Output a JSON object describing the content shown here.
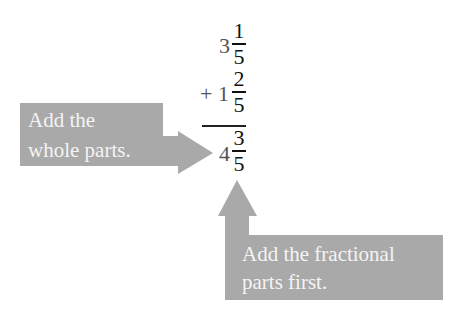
{
  "problem": {
    "addend1": {
      "whole": "3",
      "numerator": "1",
      "denominator": "5"
    },
    "addend2": {
      "sign": "+",
      "whole": "1",
      "numerator": "2",
      "denominator": "5"
    },
    "result": {
      "whole": "4",
      "numerator": "3",
      "denominator": "5"
    }
  },
  "callouts": {
    "whole": {
      "line1": "Add the",
      "line2": "whole parts."
    },
    "fraction": {
      "line1": "Add the fractional",
      "line2": "parts first."
    }
  },
  "colors": {
    "callout_fill": "#a9a9a9",
    "text": "#111111",
    "whole_number": "#555555"
  }
}
